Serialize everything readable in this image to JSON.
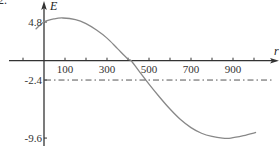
{
  "figure": {
    "corner_label": "2."
  },
  "chart_data": {
    "type": "line",
    "title": "",
    "xlabel": "r",
    "ylabel": "E",
    "xlim": [
      -100,
      1060
    ],
    "ylim": [
      -10,
      5.5
    ],
    "x_ticks": [
      -100,
      0,
      100,
      200,
      300,
      400,
      500,
      600,
      700,
      800,
      900,
      1000
    ],
    "x_tick_labels": [
      {
        "value": 100,
        "label": "100"
      },
      {
        "value": 300,
        "label": "300"
      },
      {
        "value": 500,
        "label": "500"
      },
      {
        "value": 700,
        "label": "700"
      },
      {
        "value": 900,
        "label": "900"
      }
    ],
    "y_tick_labels": [
      {
        "value": 4.8,
        "label": "4.8"
      },
      {
        "value": -2.4,
        "label": "-2.4"
      },
      {
        "value": -9.6,
        "label": "-9.6"
      }
    ],
    "grid": false,
    "legend": null,
    "series": [
      {
        "name": "E(r)",
        "style": "solid",
        "color": "#888888",
        "x": [
          -40,
          0,
          50,
          90,
          150,
          200,
          250,
          300,
          350,
          400,
          415,
          450,
          500,
          550,
          600,
          650,
          700,
          750,
          800,
          850,
          890,
          950,
          1010
        ],
        "y": [
          3.9,
          4.8,
          5.2,
          5.3,
          5.1,
          4.6,
          3.8,
          2.8,
          1.5,
          0.2,
          0.0,
          -1.2,
          -2.9,
          -4.5,
          -6.0,
          -7.3,
          -8.3,
          -9.0,
          -9.4,
          -9.6,
          -9.6,
          -9.3,
          -8.9
        ]
      },
      {
        "name": "E = -2.4",
        "style": "dash-dot",
        "color": "#555555",
        "x": [
          0,
          1090
        ],
        "y": [
          -2.4,
          -2.4
        ]
      }
    ]
  }
}
